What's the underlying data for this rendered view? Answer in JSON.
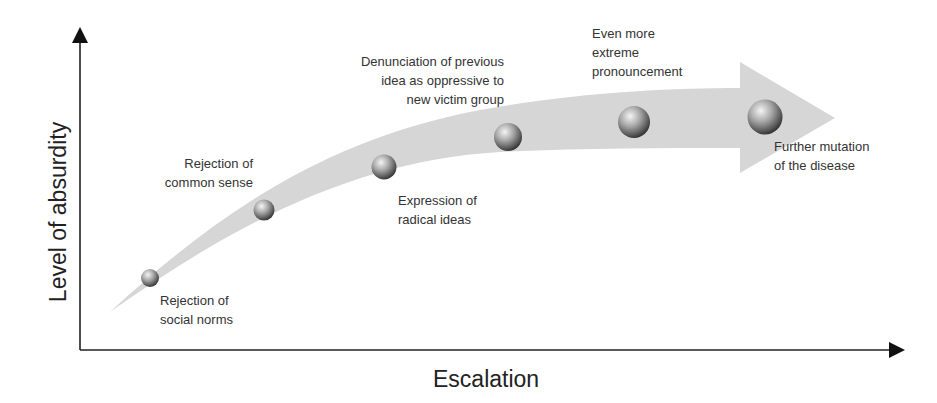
{
  "diagram": {
    "type": "escalation-arrow",
    "x_axis_label": "Escalation",
    "y_axis_label": "Level of absurdity",
    "stages": [
      {
        "lines": [
          "Rejection of",
          "social norms"
        ]
      },
      {
        "lines": [
          "Rejection of",
          "common sense"
        ]
      },
      {
        "lines": [
          "Expression of",
          "radical ideas"
        ]
      },
      {
        "lines": [
          "Denunciation of previous",
          "idea as oppressive to",
          "new victim group"
        ]
      },
      {
        "lines": [
          "Even more",
          "extreme",
          "pronouncement"
        ]
      },
      {
        "lines": [
          "Further mutation",
          "of the disease"
        ]
      }
    ],
    "colors": {
      "arrow_fill": "#d6d6d6",
      "axis": "#222222",
      "sphere_light": "#f2f2f2",
      "sphere_dark": "#4a4a4a"
    }
  }
}
